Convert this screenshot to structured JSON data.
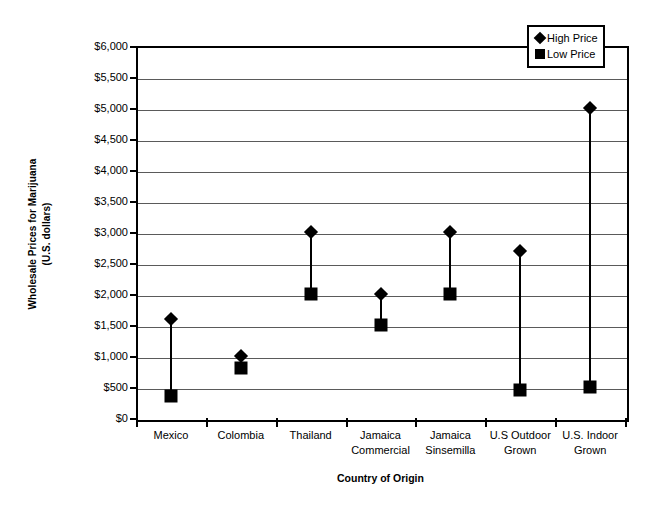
{
  "chart_data": {
    "type": "scatter",
    "title": "",
    "xlabel": "Country of Origin",
    "ylabel": "Wholesale Prices for Marijuana\n(U.S. dollars)",
    "ylabel_line1": "Wholesale Prices for Marijuana",
    "ylabel_line2": "(U.S. dollars)",
    "ylim": [
      0,
      6000
    ],
    "ytick_step": 500,
    "grid": true,
    "legend_position": "top-right",
    "categories": [
      "Mexico",
      "Colombia",
      "Thailand",
      "Jamaica\nCommercial",
      "Jamaica\nSinsemilla",
      "U.S Outdoor\nGrown",
      "U.S. Indoor\nGrown"
    ],
    "ytick_labels": [
      "$0",
      "$500",
      "$1,000",
      "$1,500",
      "$2,000",
      "$2,500",
      "$3,000",
      "$3,500",
      "$4,000",
      "$4,500",
      "$5,000",
      "$5,500",
      "$6,000"
    ],
    "ytick_values": [
      0,
      500,
      1000,
      1500,
      2000,
      2500,
      3000,
      3500,
      4000,
      4500,
      5000,
      5500,
      6000
    ],
    "series": [
      {
        "name": "High Price",
        "marker": "diamond",
        "color": "#000000",
        "values": [
          1600,
          1000,
          3000,
          2000,
          3000,
          2700,
          5000
        ]
      },
      {
        "name": "Low Price",
        "marker": "square",
        "color": "#000000",
        "values": [
          350,
          800,
          2000,
          1500,
          2000,
          450,
          500
        ]
      }
    ]
  },
  "legend": {
    "items": [
      {
        "label": "High Price",
        "marker": "diamond"
      },
      {
        "label": "Low Price",
        "marker": "square"
      }
    ]
  }
}
